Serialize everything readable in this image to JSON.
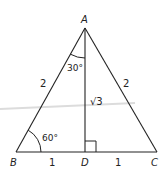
{
  "diagram": {
    "vertices": {
      "A": "A",
      "B": "B",
      "C": "C",
      "D": "D"
    },
    "side_labels": {
      "AB": "2",
      "AC": "2",
      "BD": "1",
      "DC": "1",
      "AD": "√3"
    },
    "angle_labels": {
      "BAD": "30°",
      "ABD": "60°"
    },
    "colors": {
      "line": "#222222",
      "streak": "#d8d8d8"
    }
  }
}
